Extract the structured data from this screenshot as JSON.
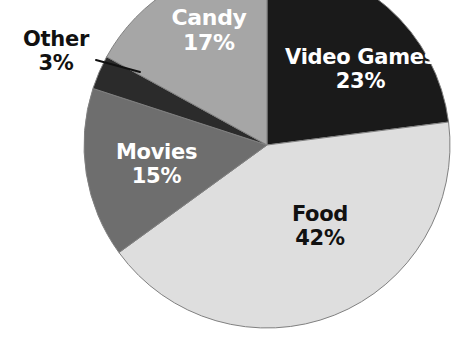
{
  "chart_data": {
    "type": "pie",
    "title": "",
    "subtitle": "",
    "xlabel": "",
    "ylabel": "",
    "legend_position": "none",
    "grid": false,
    "units": "percent",
    "total": 100,
    "categories": [
      "Video Games",
      "Food",
      "Movies",
      "Other",
      "Candy"
    ],
    "values": [
      23,
      42,
      15,
      3,
      17
    ],
    "start_angle_deg": 0,
    "direction": "clockwise",
    "slices": [
      {
        "name": "Video Games",
        "value": 23,
        "value_text": "23%",
        "color": "#1a1a1a",
        "label_color": "#ffffff",
        "label_placement": "inside",
        "start_deg": 0,
        "end_deg": 82.8
      },
      {
        "name": "Food",
        "value": 42,
        "value_text": "42%",
        "color": "#dedede",
        "label_color": "#111111",
        "label_placement": "inside",
        "start_deg": 82.8,
        "end_deg": 234.0
      },
      {
        "name": "Movies",
        "value": 15,
        "value_text": "15%",
        "color": "#6e6e6e",
        "label_color": "#ffffff",
        "label_placement": "inside",
        "start_deg": 234.0,
        "end_deg": 288.0
      },
      {
        "name": "Other",
        "value": 3,
        "value_text": "3%",
        "color": "#2b2b2b",
        "label_color": "#111111",
        "label_placement": "outside-with-leader",
        "start_deg": 288.0,
        "end_deg": 298.8
      },
      {
        "name": "Candy",
        "value": 17,
        "value_text": "17%",
        "color": "#a6a6a6",
        "label_color": "#ffffff",
        "label_placement": "inside",
        "start_deg": 298.8,
        "end_deg": 360.0
      }
    ],
    "geometry": {
      "center_x": 267,
      "center_y": 145,
      "radius": 183,
      "cropped_edges": [
        "top",
        "right",
        "bottom"
      ]
    },
    "background_color": "#ffffff",
    "outline_color": "#808080"
  }
}
